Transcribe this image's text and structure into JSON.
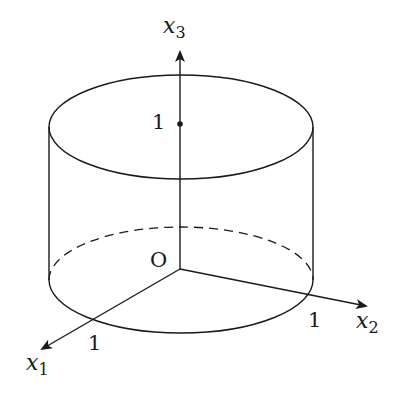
{
  "diagram": {
    "type": "3d-cylinder-with-axes",
    "labels": {
      "x1_axis": "x",
      "x1_sub": "1",
      "x2_axis": "x",
      "x2_sub": "2",
      "x3_axis": "x",
      "x3_sub": "3",
      "origin": "O",
      "tick_x1": "1",
      "tick_x2": "1",
      "tick_x3": "1"
    },
    "colors": {
      "stroke": "#1a1a1a",
      "background": "#ffffff"
    }
  }
}
